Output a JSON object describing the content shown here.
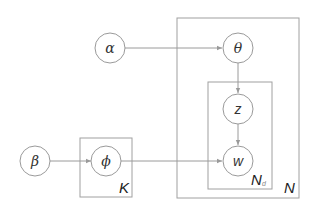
{
  "diagram": {
    "type": "plate-notation",
    "nodes": [
      {
        "id": "alpha",
        "label": "α",
        "cx": 110,
        "cy": 48
      },
      {
        "id": "theta",
        "label": "θ",
        "cx": 238,
        "cy": 48
      },
      {
        "id": "z",
        "label": "z",
        "cx": 238,
        "cy": 109
      },
      {
        "id": "w",
        "label": "w",
        "cx": 238,
        "cy": 161
      },
      {
        "id": "beta",
        "label": "β",
        "cx": 35,
        "cy": 161
      },
      {
        "id": "phi",
        "label": "ϕ",
        "cx": 106,
        "cy": 161
      }
    ],
    "edges": [
      {
        "from": "alpha",
        "to": "theta"
      },
      {
        "from": "theta",
        "to": "z"
      },
      {
        "from": "z",
        "to": "w"
      },
      {
        "from": "beta",
        "to": "phi"
      },
      {
        "from": "phi",
        "to": "w"
      }
    ],
    "plates": {
      "outer": {
        "label": "N",
        "x": 177,
        "y": 18,
        "w": 122,
        "h": 180
      },
      "inner": {
        "label": "N",
        "subscript": "d",
        "x": 208,
        "y": 82,
        "w": 64,
        "h": 107
      },
      "topic": {
        "label": "K",
        "x": 80,
        "y": 138,
        "w": 52,
        "h": 59
      }
    },
    "colors": {
      "stroke": "#9a9a9a",
      "text": "#333333"
    }
  }
}
